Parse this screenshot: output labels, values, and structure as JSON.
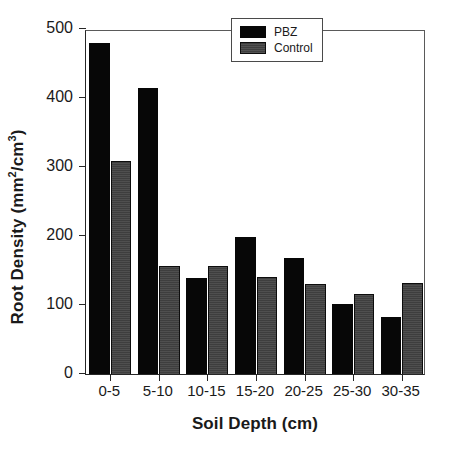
{
  "chart_data": {
    "type": "bar",
    "title": "",
    "xlabel": "Soil Depth (cm)",
    "ylabel_full": "Root Density (mm2/cm3)",
    "ylabel_parts": {
      "prefix": "Root Density (mm",
      "sup1": "2",
      "middle": "/cm",
      "sup2": "3",
      "suffix": ")"
    },
    "categories": [
      "0-5",
      "5-10",
      "10-15",
      "15-20",
      "20-25",
      "25-30",
      "30-35"
    ],
    "series": [
      {
        "name": "PBZ",
        "color": "#070707",
        "values": [
          480,
          415,
          139,
          198,
          168,
          101,
          83
        ]
      },
      {
        "name": "Control",
        "color": "#3e3e3e",
        "values": [
          308,
          156,
          156,
          140,
          131,
          116,
          132
        ]
      }
    ],
    "ylim": [
      0,
      500
    ],
    "yticks": [
      0,
      100,
      200,
      300,
      400,
      500
    ],
    "ytick_labels": [
      "0",
      "100",
      "200",
      "300",
      "400",
      "500"
    ],
    "grid": false,
    "legend_position": "top-right"
  },
  "legend": {
    "entries": [
      {
        "label": "PBZ"
      },
      {
        "label": "Control"
      }
    ]
  }
}
